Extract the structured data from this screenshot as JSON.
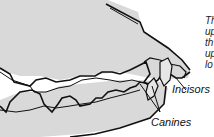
{
  "figure": {
    "fill_color": "#d9d9d9",
    "line_color": "#111111"
  },
  "labels": {
    "incisors": "Incisors",
    "canines": "Canines"
  },
  "caption_fragments": [
    "Th",
    "up",
    "th",
    "up",
    "lo"
  ]
}
